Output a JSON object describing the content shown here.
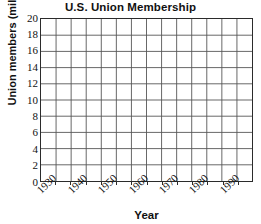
{
  "chart_data": {
    "type": "line",
    "title": "U.S. Union Membership",
    "xlabel": "Year",
    "ylabel": "Union members (millions)",
    "grid": true,
    "legend": "none",
    "series": [],
    "x": [],
    "values": [],
    "xlim": [
      1925,
      1995
    ],
    "ylim": [
      0,
      20
    ],
    "y_ticks": [
      20,
      18,
      16,
      14,
      12,
      10,
      8,
      6,
      4,
      2,
      0
    ],
    "y_tick_labels": [
      "20",
      "18",
      "16",
      "14",
      "12",
      "10",
      "8",
      "6",
      "4",
      "2",
      "0"
    ],
    "y_major_step": 2,
    "x_ticks": [
      1930,
      1940,
      1950,
      1960,
      1970,
      1980,
      1990
    ],
    "x_tick_labels": [
      "1930",
      "1940",
      "1950",
      "1960",
      "1970",
      "1980",
      "1990"
    ],
    "x_major_step": 10,
    "x_minor_step": 5,
    "x_gridline_count": 14,
    "y_gridline_count": 10,
    "note": "blank plotting grid, no data plotted",
    "colors": {
      "axis": "#2b2b2b",
      "grid": "#555555",
      "text": "#111111",
      "background": "#ffffff"
    }
  }
}
